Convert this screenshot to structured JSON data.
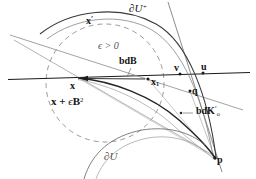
{
  "figure": {
    "type": "geometry-diagram",
    "width": 256,
    "height": 179,
    "background": "#ffffff",
    "ink_color": "#141414",
    "faint_color": "#9a9a9a",
    "dash_color": "#8d8d8d"
  },
  "labels": {
    "boundary_u_plus": "∂U",
    "boundary_u_plus_sup": "+",
    "boundary_u": "∂U",
    "x_prime": "x",
    "x_prime_mark": "′",
    "epsilon_condition": "ϵ > 0",
    "bd_b": "bdB",
    "x_point": "x",
    "x_one": "x",
    "x_one_sub": "1",
    "v_point": "v",
    "u_point": "u",
    "q_point": "q",
    "p_point": "p",
    "bd_k_prime": "bdK",
    "bd_k_prime_mark": "′",
    "bd_k_sub": "o",
    "ball_label_lead": "x + ",
    "ball_label_eps": "ϵ",
    "ball_label_b": "B",
    "ball_label_exp": "2"
  },
  "points": [
    {
      "name": "x",
      "cx": 77,
      "cy": 78
    },
    {
      "name": "x1",
      "cx": 148,
      "cy": 79
    },
    {
      "name": "v",
      "cx": 180,
      "cy": 74
    },
    {
      "name": "u",
      "cx": 203,
      "cy": 73
    },
    {
      "name": "q",
      "cx": 190,
      "cy": 91
    },
    {
      "name": "p",
      "cx": 215,
      "cy": 158
    },
    {
      "name": "bdK-tick",
      "cx": 189,
      "cy": 114
    }
  ],
  "curves": {
    "dashed_ball_center": [
      105,
      83
    ],
    "dashed_ball_radius": 59,
    "horizontal_line_y": 79
  }
}
